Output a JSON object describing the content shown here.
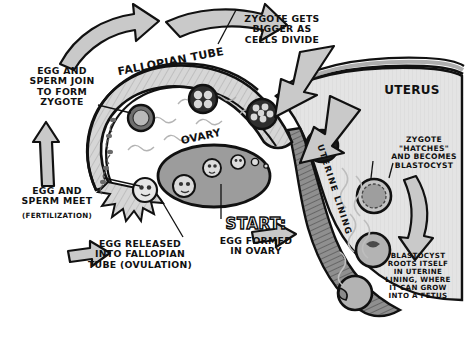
{
  "diagram": {
    "background_color": "#ffffff",
    "ink_color": "#111111",
    "arrow_fill": "#c9c9c9",
    "tissue_fill": "#d8d8d8",
    "lining_fill": "#8f8f8f",
    "ovary_fill": "#9a9a9a",
    "uterus_fill": "#e2e2e2"
  },
  "labels": {
    "fallopian_tube": "FALLOPIAN  TUBE",
    "ovary": "OVARY",
    "uterus": "UTERUS",
    "uterine_lining": "UTERINE LINING",
    "start": "START:",
    "egg_formed": "EGG FORMED\nIN OVARY",
    "egg_released": "EGG RELEASED\nINTO FALLOPIAN\nTUBE (OVULATION)",
    "egg_sperm_meet": "EGG AND\nSPERM MEET",
    "fertilization": "(FERTILIZATION)",
    "egg_sperm_join": "EGG AND\nSPERM JOIN\nTO FORM\nZYGOTE",
    "zygote_divides": "ZYGOTE GETS\nBIGGER AS\nCELLS DIVIDE",
    "zygote_hatches": "ZYGOTE\n\"HATCHES\"\nAND BECOMES\nBLASTOCYST",
    "blastocyst_roots": "BLASTOCYST\nROOTS ITSELF\nIN UTERINE\nLINING, WHERE\nIT CAN GROW\nINTO A FETUS"
  },
  "stages": [
    {
      "id": "egg-formed-in-ovary",
      "order": 1,
      "name": "Egg formed in ovary"
    },
    {
      "id": "ovulation",
      "order": 2,
      "name": "Egg released into fallopian tube"
    },
    {
      "id": "fertilization",
      "order": 3,
      "name": "Egg and sperm meet"
    },
    {
      "id": "zygote-formation",
      "order": 4,
      "name": "Egg and sperm join to form zygote"
    },
    {
      "id": "cleavage",
      "order": 5,
      "name": "Zygote gets bigger as cells divide"
    },
    {
      "id": "hatching",
      "order": 6,
      "name": "Zygote hatches and becomes blastocyst"
    },
    {
      "id": "implantation",
      "order": 7,
      "name": "Blastocyst roots itself in uterine lining"
    }
  ],
  "arrows": [
    {
      "id": "arrow-left-up",
      "direction": "up"
    },
    {
      "id": "arrow-top-left-curve",
      "direction": "right"
    },
    {
      "id": "arrow-top-right-curve",
      "direction": "right"
    },
    {
      "id": "arrow-into-uterus-upper",
      "direction": "down-right"
    },
    {
      "id": "arrow-into-uterus-lower",
      "direction": "down-right"
    },
    {
      "id": "arrow-right-down",
      "direction": "down"
    },
    {
      "id": "arrow-bottom-left",
      "direction": "left"
    },
    {
      "id": "arrow-bottom-right",
      "direction": "left"
    }
  ]
}
